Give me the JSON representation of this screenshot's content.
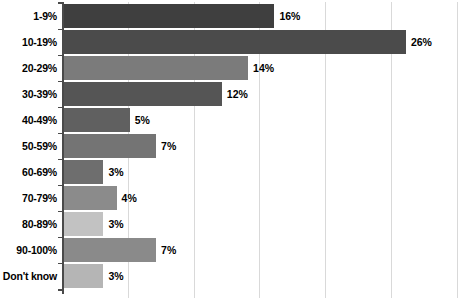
{
  "chart_data": {
    "type": "bar",
    "orientation": "horizontal",
    "title": "",
    "subtitle": "",
    "xlabel": "",
    "ylabel": "",
    "categories": [
      "1-9%",
      "10-19%",
      "20-29%",
      "30-39%",
      "40-49%",
      "50-59%",
      "60-69%",
      "70-79%",
      "80-89%",
      "90-100%",
      "Don't know"
    ],
    "values": [
      16,
      26,
      14,
      12,
      5,
      7,
      3,
      4,
      3,
      7,
      3
    ],
    "value_labels": [
      "16%",
      "26%",
      "14%",
      "12%",
      "5%",
      "7%",
      "3%",
      "4%",
      "3%",
      "7%",
      "3%"
    ],
    "bar_colors": [
      "#3f3f3f",
      "#4b4b4b",
      "#7b7b7b",
      "#555555",
      "#606060",
      "#747474",
      "#6e6e6e",
      "#8b8b8b",
      "#c2c2c2",
      "#8a8a8a",
      "#b5b5b5"
    ],
    "xlim": [
      0,
      30
    ],
    "xticks": [
      0,
      5,
      10,
      15,
      20,
      25,
      30
    ],
    "grid": true,
    "gridline_color": "#d9d9d9",
    "axis_color": "#4a4a4a",
    "legend": "none",
    "show_xticklabels": false,
    "background": "#ffffff"
  }
}
